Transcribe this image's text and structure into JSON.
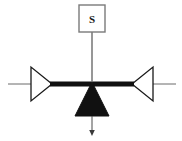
{
  "diagram": {
    "title": "",
    "type": "schematic",
    "background_color": "#ffffff",
    "line_color_thin": "#6b6b6b",
    "line_color_thick": "#111111",
    "fill_color": "#111111",
    "source_block": {
      "label": "S",
      "shape": "square",
      "border_color": "#7a7a7a",
      "fill": "#ffffff",
      "x": 79,
      "y": 5,
      "width": 26,
      "height": 27
    },
    "connector_vertical": {
      "name": "source-to-beam-link",
      "from_y": 32,
      "to_y": 84,
      "x": 92
    },
    "beam": {
      "name": "horizontal-beam",
      "x1": 52,
      "x2": 132,
      "y": 84,
      "thickness": 5
    },
    "left_amplifier": {
      "label": "",
      "direction": "right",
      "apex_x": 52,
      "base_x": 31,
      "top_y": 67,
      "bottom_y": 101
    },
    "right_amplifier": {
      "label": "",
      "direction": "left",
      "apex_x": 132,
      "base_x": 153,
      "top_y": 67,
      "bottom_y": 101
    },
    "left_lead": {
      "name": "left-terminal-lead",
      "x1": 8,
      "x2": 31,
      "y": 84
    },
    "right_lead": {
      "name": "right-terminal-lead",
      "x1": 153,
      "x2": 176,
      "y": 84
    },
    "pivot": {
      "name": "pivot-triangle",
      "apex_x": 92,
      "apex_y": 84,
      "base_left_x": 75,
      "base_right_x": 109,
      "base_y": 116,
      "filled": true
    },
    "output_arrow": {
      "name": "downward-output-arrow",
      "x": 92,
      "from_y": 116,
      "to_y": 135
    }
  }
}
